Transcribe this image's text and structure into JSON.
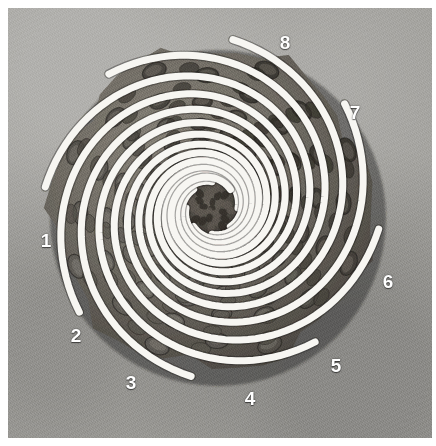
{
  "figure": {
    "view": "end-on / apex",
    "medium": "black-and-white photograph",
    "width": 436,
    "height": 446,
    "plate": {
      "x": 8,
      "y": 8,
      "width": 424,
      "height": 430
    },
    "border_color": "#ffffff",
    "backdrop_color": "#a3a29e"
  },
  "colors": {
    "overlay_stroke": "#f7f6f2",
    "label_text": "#ffffff",
    "cone_dark": "#4b4741",
    "cone_mid": "#6e6a62",
    "cone_light": "#8d887e",
    "core_dark": "#3a3732"
  },
  "cone": {
    "center": {
      "x": 212,
      "y": 208
    },
    "outline_radius_x": 158,
    "outline_radius_y": 160,
    "core_radius": 26,
    "scale_rows": 13,
    "description": "overlapping woody scales arranged in opposing parallastic spirals"
  },
  "overlay": {
    "type": "logarithmic-spiral-family",
    "arm_count": 8,
    "direction": "counter-clockwise outward",
    "stroke_width": 7,
    "growth_b": 0.185,
    "inner_radius": 26,
    "outer_radius": 168,
    "arms": [
      {
        "id": 1,
        "label": "1",
        "phase_deg": 0,
        "label_x": 46,
        "label_y": 240
      },
      {
        "id": 2,
        "label": "2",
        "phase_deg": 45,
        "label_x": 76,
        "label_y": 335
      },
      {
        "id": 3,
        "label": "3",
        "phase_deg": 90,
        "label_x": 131,
        "label_y": 382
      },
      {
        "id": 4,
        "label": "4",
        "phase_deg": 135,
        "label_x": 250,
        "label_y": 398
      },
      {
        "id": 5,
        "label": "5",
        "phase_deg": 180,
        "label_x": 336,
        "label_y": 365
      },
      {
        "id": 6,
        "label": "6",
        "phase_deg": 225,
        "label_x": 388,
        "label_y": 281
      },
      {
        "id": 7,
        "label": "7",
        "phase_deg": 270,
        "label_x": 355,
        "label_y": 112
      },
      {
        "id": 8,
        "label": "8",
        "phase_deg": 315,
        "label_x": 285,
        "label_y": 42
      }
    ]
  },
  "labels": {
    "items": [
      "1",
      "2",
      "3",
      "4",
      "5",
      "6",
      "7",
      "8"
    ]
  }
}
